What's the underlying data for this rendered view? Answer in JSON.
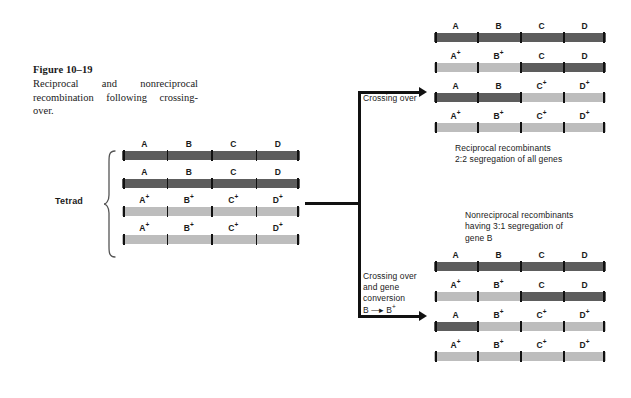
{
  "figure": {
    "number": "Figure 10–19",
    "caption": "Reciprocal and nonreciprocal recombination following crossing-over."
  },
  "tetrad": {
    "label": "Tetrad",
    "gene_labels": [
      "A",
      "B",
      "C",
      "D"
    ],
    "chromosomes": [
      {
        "name": "chromatid-1",
        "segments": [
          {
            "gene": "A",
            "allele": "A",
            "shade": "dark"
          },
          {
            "gene": "B",
            "allele": "B",
            "shade": "dark"
          },
          {
            "gene": "C",
            "allele": "C",
            "shade": "dark"
          },
          {
            "gene": "D",
            "allele": "D",
            "shade": "dark"
          }
        ]
      },
      {
        "name": "chromatid-2",
        "segments": [
          {
            "gene": "A",
            "allele": "A",
            "shade": "dark"
          },
          {
            "gene": "B",
            "allele": "B",
            "shade": "dark"
          },
          {
            "gene": "C",
            "allele": "C",
            "shade": "dark"
          },
          {
            "gene": "D",
            "allele": "D",
            "shade": "dark"
          }
        ]
      },
      {
        "name": "chromatid-3",
        "segments": [
          {
            "gene": "A",
            "allele": "A+",
            "shade": "light"
          },
          {
            "gene": "B",
            "allele": "B+",
            "shade": "light"
          },
          {
            "gene": "C",
            "allele": "C+",
            "shade": "light"
          },
          {
            "gene": "D",
            "allele": "D+",
            "shade": "light"
          }
        ]
      },
      {
        "name": "chromatid-4",
        "segments": [
          {
            "gene": "A",
            "allele": "A+",
            "shade": "light"
          },
          {
            "gene": "B",
            "allele": "B+",
            "shade": "light"
          },
          {
            "gene": "C",
            "allele": "C+",
            "shade": "light"
          },
          {
            "gene": "D",
            "allele": "D+",
            "shade": "light"
          }
        ]
      }
    ]
  },
  "branches": {
    "upper": {
      "arrow_label_lines": [
        "Crossing over"
      ],
      "result_lines": [
        "Reciprocal recombinants",
        "2:2 segregation of all genes"
      ],
      "chromosomes": [
        {
          "name": "product-1",
          "segments": [
            {
              "allele": "A",
              "shade": "dark"
            },
            {
              "allele": "B",
              "shade": "dark"
            },
            {
              "allele": "C",
              "shade": "dark"
            },
            {
              "allele": "D",
              "shade": "dark"
            }
          ]
        },
        {
          "name": "product-2",
          "segments": [
            {
              "allele": "A+",
              "shade": "light"
            },
            {
              "allele": "B+",
              "shade": "light"
            },
            {
              "allele": "C",
              "shade": "dark"
            },
            {
              "allele": "D",
              "shade": "dark"
            }
          ]
        },
        {
          "name": "product-3",
          "segments": [
            {
              "allele": "A",
              "shade": "dark"
            },
            {
              "allele": "B",
              "shade": "dark"
            },
            {
              "allele": "C+",
              "shade": "light"
            },
            {
              "allele": "D+",
              "shade": "light"
            }
          ]
        },
        {
          "name": "product-4",
          "segments": [
            {
              "allele": "A+",
              "shade": "light"
            },
            {
              "allele": "B+",
              "shade": "light"
            },
            {
              "allele": "C+",
              "shade": "light"
            },
            {
              "allele": "D+",
              "shade": "light"
            }
          ]
        }
      ]
    },
    "lower": {
      "arrow_label_lines": [
        "Crossing over",
        "and gene",
        "conversion"
      ],
      "conversion": {
        "from": "B",
        "arrow": "→",
        "to": "B+"
      },
      "result_lines": [
        "Nonreciprocal recombinants",
        "having 3:1 segregation of",
        "gene B"
      ],
      "chromosomes": [
        {
          "name": "product-1",
          "segments": [
            {
              "allele": "A",
              "shade": "dark"
            },
            {
              "allele": "B",
              "shade": "dark"
            },
            {
              "allele": "C",
              "shade": "dark"
            },
            {
              "allele": "D",
              "shade": "dark"
            }
          ]
        },
        {
          "name": "product-2",
          "segments": [
            {
              "allele": "A+",
              "shade": "light"
            },
            {
              "allele": "B+",
              "shade": "light"
            },
            {
              "allele": "C",
              "shade": "dark"
            },
            {
              "allele": "D",
              "shade": "dark"
            }
          ]
        },
        {
          "name": "product-3",
          "segments": [
            {
              "allele": "A",
              "shade": "dark"
            },
            {
              "allele": "B+",
              "shade": "light"
            },
            {
              "allele": "C+",
              "shade": "light"
            },
            {
              "allele": "D+",
              "shade": "light"
            }
          ]
        },
        {
          "name": "product-4",
          "segments": [
            {
              "allele": "A+",
              "shade": "light"
            },
            {
              "allele": "B+",
              "shade": "light"
            },
            {
              "allele": "C+",
              "shade": "light"
            },
            {
              "allele": "D+",
              "shade": "light"
            }
          ]
        }
      ]
    }
  },
  "colors": {
    "dark_allele": "#5d5d5d",
    "light_allele": "#bdbdbd",
    "line": "#111111",
    "background": "#ffffff"
  },
  "geometry": {
    "tetrad_bar_width": 178,
    "branch_bar_width": 172,
    "bar_height": 9
  }
}
